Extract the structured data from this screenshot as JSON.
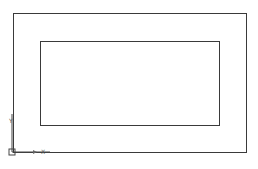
{
  "drawing": {
    "background": "#ffffff",
    "line_color": "#3a3a3a",
    "outer_rect": {
      "x": 13,
      "y": 13,
      "w": 234,
      "h": 140
    },
    "inner_rect": {
      "x": 40,
      "y": 41,
      "w": 180,
      "h": 85
    }
  },
  "ucs_icon": {
    "x_label": "X",
    "y_label": "Y"
  }
}
